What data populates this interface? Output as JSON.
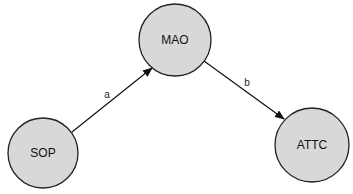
{
  "diagram": {
    "type": "path-diagram",
    "nodes": [
      {
        "id": "sop",
        "label": "SOP",
        "cx": 43,
        "cy": 153,
        "r": 35
      },
      {
        "id": "mao",
        "label": "MAO",
        "cx": 175,
        "cy": 40,
        "r": 36
      },
      {
        "id": "attc",
        "label": "ATTC",
        "cx": 312,
        "cy": 145,
        "r": 37
      }
    ],
    "edges": [
      {
        "id": "a",
        "from": "SOP",
        "to": "MAO",
        "label": "a"
      },
      {
        "id": "b",
        "from": "MAO",
        "to": "ATTC",
        "label": "b"
      }
    ],
    "colors": {
      "node_fill": "#d8d8d8",
      "node_stroke": "#222222",
      "edge": "#111111",
      "background": "#ffffff"
    }
  }
}
